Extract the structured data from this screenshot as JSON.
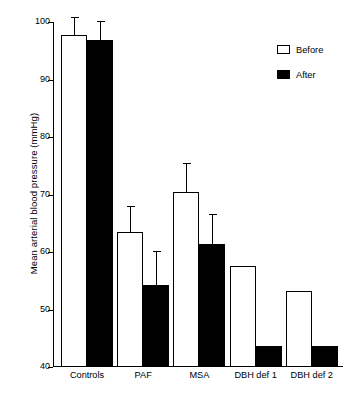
{
  "chart_data": {
    "type": "bar",
    "title": "",
    "subtitle": "",
    "xlabel": "",
    "ylabel": "Mean arterial blood pressure (mmHg)",
    "categories": [
      "Controls",
      "PAF",
      "MSA",
      "DBH def 1",
      "DBH def 2"
    ],
    "series": [
      {
        "name": "Before",
        "color": "#ffffff",
        "edge_color": "#000000",
        "values": [
          97.7,
          63.5,
          70.4,
          57.6,
          53.3
        ],
        "errors": [
          3.1,
          4.5,
          5.0,
          0,
          0
        ]
      },
      {
        "name": "After",
        "color": "#000000",
        "edge_color": "#000000",
        "values": [
          96.8,
          54.2,
          61.4,
          43.6,
          43.6
        ],
        "errors": [
          3.3,
          5.9,
          5.2,
          0,
          0
        ]
      }
    ],
    "ylim": [
      40,
      100
    ],
    "yticks": [
      40,
      50,
      60,
      70,
      80,
      90,
      100
    ],
    "ytick_labels": [
      "40",
      "50",
      "60",
      "70",
      "80",
      "90",
      "100"
    ],
    "grid": false,
    "legend_position": "top-right",
    "error_bar_style": "upper-only-with-cap"
  },
  "legend": {
    "entries": [
      {
        "label": "Before",
        "swatch": "open-square-swatch"
      },
      {
        "label": "After",
        "swatch": "filled-square-swatch"
      }
    ]
  }
}
